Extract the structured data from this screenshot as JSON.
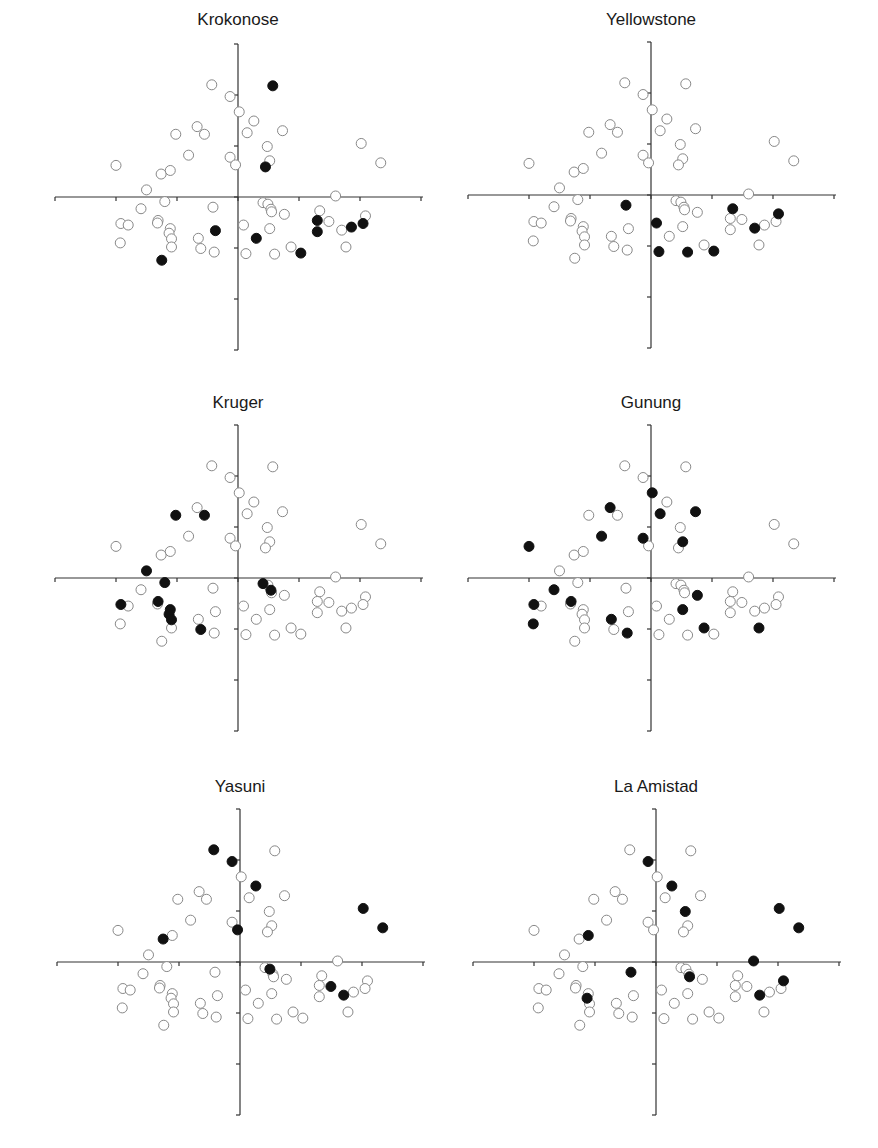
{
  "chart_data": {
    "type": "scatter",
    "layout": {
      "grid": [
        3,
        2
      ],
      "axis_range_x": [
        -3,
        3
      ],
      "axis_range_y": [
        -3,
        3
      ],
      "tick_step": 1,
      "gridlines": false,
      "axis_labels": false,
      "tick_labels": false,
      "marker": "circle",
      "open_marker_color": "#888888",
      "filled_marker_color": "#111111"
    },
    "points": [
      [
        -0.43,
        2.2
      ],
      [
        -0.13,
        1.97
      ],
      [
        0.57,
        2.18
      ],
      [
        0.02,
        1.67
      ],
      [
        0.26,
        1.49
      ],
      [
        -0.67,
        1.38
      ],
      [
        -0.55,
        1.23
      ],
      [
        -1.02,
        1.23
      ],
      [
        0.15,
        1.26
      ],
      [
        0.73,
        1.3
      ],
      [
        0.48,
        0.99
      ],
      [
        2.02,
        1.05
      ],
      [
        -0.81,
        0.82
      ],
      [
        -0.13,
        0.78
      ],
      [
        -0.04,
        0.63
      ],
      [
        0.52,
        0.71
      ],
      [
        0.45,
        0.59
      ],
      [
        -2.0,
        0.62
      ],
      [
        2.34,
        0.67
      ],
      [
        -1.26,
        0.45
      ],
      [
        -1.11,
        0.52
      ],
      [
        -1.5,
        0.14
      ],
      [
        1.6,
        0.02
      ],
      [
        -1.2,
        -0.09
      ],
      [
        -1.59,
        -0.23
      ],
      [
        -0.41,
        -0.2
      ],
      [
        0.41,
        -0.11
      ],
      [
        0.49,
        -0.14
      ],
      [
        0.54,
        -0.24
      ],
      [
        0.55,
        -0.29
      ],
      [
        0.76,
        -0.34
      ],
      [
        1.34,
        -0.27
      ],
      [
        2.09,
        -0.37
      ],
      [
        -1.92,
        -0.52
      ],
      [
        -1.8,
        -0.55
      ],
      [
        -1.31,
        -0.46
      ],
      [
        -1.32,
        -0.51
      ],
      [
        -1.11,
        -0.62
      ],
      [
        -1.13,
        -0.71
      ],
      [
        -1.09,
        -0.82
      ],
      [
        -1.09,
        -0.98
      ],
      [
        -0.65,
        -0.81
      ],
      [
        -0.61,
        -1.01
      ],
      [
        -0.39,
        -1.08
      ],
      [
        -1.93,
        -0.9
      ],
      [
        -1.25,
        -1.24
      ],
      [
        -0.37,
        -0.66
      ],
      [
        0.09,
        -0.55
      ],
      [
        0.3,
        -0.81
      ],
      [
        0.52,
        -0.62
      ],
      [
        0.13,
        -1.11
      ],
      [
        0.6,
        -1.12
      ],
      [
        0.87,
        -0.98
      ],
      [
        1.03,
        -1.1
      ],
      [
        1.3,
        -0.46
      ],
      [
        1.3,
        -0.68
      ],
      [
        1.49,
        -0.48
      ],
      [
        1.7,
        -0.65
      ],
      [
        1.86,
        -0.59
      ],
      [
        2.05,
        -0.52
      ],
      [
        1.77,
        -0.98
      ]
    ],
    "panels": [
      {
        "title": "Krokonose",
        "filled": [
          2,
          16,
          45,
          46,
          48,
          53,
          54,
          55,
          58,
          59
        ]
      },
      {
        "title": "Yellowstone",
        "filled": [
          25,
          31,
          32,
          47,
          50,
          51,
          53,
          57
        ]
      },
      {
        "title": "Kruger",
        "filled": [
          6,
          7,
          21,
          23,
          26,
          28,
          33,
          35,
          37,
          38,
          39,
          42
        ]
      },
      {
        "title": "Gunung",
        "filled": [
          3,
          5,
          8,
          9,
          12,
          13,
          15,
          17,
          24,
          30,
          33,
          35,
          41,
          43,
          44,
          49,
          52,
          60
        ]
      },
      {
        "title": "Yasuni",
        "filled": [
          0,
          1,
          4,
          11,
          14,
          18,
          19,
          27,
          56,
          57
        ]
      },
      {
        "title": "La Amistad",
        "filled": [
          1,
          4,
          10,
          11,
          18,
          20,
          22,
          25,
          29,
          32,
          38,
          57
        ]
      }
    ]
  },
  "panels": [
    {
      "title": "Krokonose"
    },
    {
      "title": "Yellowstone"
    },
    {
      "title": "Kruger"
    },
    {
      "title": "Gunung"
    },
    {
      "title": "Yasuni"
    },
    {
      "title": "La Amistad"
    }
  ]
}
